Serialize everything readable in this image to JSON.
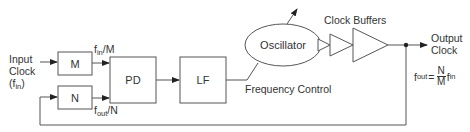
{
  "diagram": {
    "input": {
      "line1": "Input",
      "line2": "Clock",
      "line3_prefix": "(f",
      "line3_sub": "in",
      "line3_suffix": ")"
    },
    "blocks": {
      "m_divider": "M",
      "n_divider": "N",
      "phase_detector": "PD",
      "loop_filter": "LF",
      "oscillator": "Oscillator"
    },
    "signals": {
      "fin_over_m": {
        "f": "f",
        "sub": "in",
        "rest": "/M"
      },
      "fout_over_n": {
        "f": "f",
        "sub": "out",
        "rest": "/N"
      },
      "frequency_control": "Frequency Control"
    },
    "clock_buffers_label": "Clock Buffers",
    "output": {
      "line1": "Output",
      "line2": "Clock"
    },
    "formula": {
      "lhs_f": "f",
      "lhs_sub": "out",
      "equals": "=",
      "numerator": "N",
      "denominator": "M",
      "rhs_f": "f",
      "rhs_sub": "in"
    },
    "colors": {
      "stroke": "#555555",
      "text": "#333333",
      "background": "#ffffff"
    }
  }
}
